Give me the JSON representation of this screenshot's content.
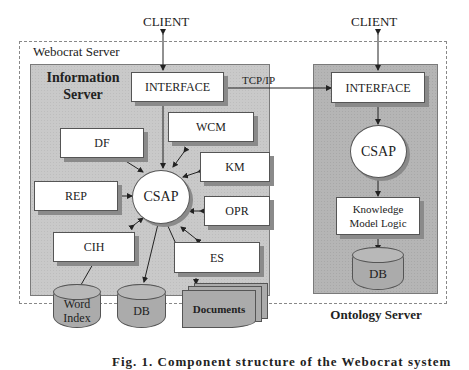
{
  "diagram": {
    "clients": [
      {
        "label": "CLIENT"
      },
      {
        "label": "CLIENT"
      }
    ],
    "outer_container": {
      "label": "Webocrat Server"
    },
    "information_server": {
      "title_line1": "Information",
      "title_line2": "Server",
      "interface": "INTERFACE",
      "hub": "CSAP",
      "modules": [
        "DF",
        "WCM",
        "KM",
        "REP",
        "OPR",
        "CIH",
        "ES"
      ],
      "stores": {
        "word_index_line1": "Word",
        "word_index_line2": "Index",
        "db": "DB",
        "documents": "Documents"
      }
    },
    "link_label": "TCP/IP",
    "ontology_server": {
      "title": "Ontology Server",
      "interface": "INTERFACE",
      "hub": "CSAP",
      "logic_line1": "Knowledge",
      "logic_line2": "Model Logic",
      "db": "DB"
    },
    "caption": "Fig. 1. Component structure of the Webocrat system"
  }
}
